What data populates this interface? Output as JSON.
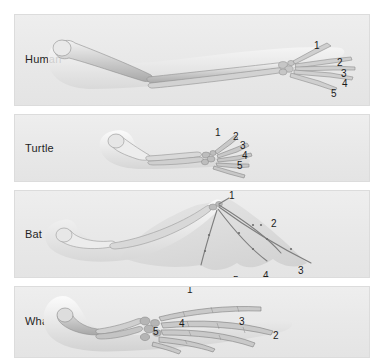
{
  "figure": {
    "title_row": {
      "bones": [
        {
          "label": "Humerus",
          "emphasis": "strong",
          "x": 68
        },
        {
          "label": "Radius",
          "emphasis": "mid",
          "x": 124
        },
        {
          "label": "Ulna",
          "emphasis": "light",
          "x": 169
        },
        {
          "label": "Carpal",
          "emphasis": "mid",
          "x": 201
        },
        {
          "label": "Metacarpal",
          "emphasis": "light",
          "x": 243
        },
        {
          "label": "Phalanges",
          "emphasis": "light",
          "x": 305
        }
      ]
    },
    "panels": [
      {
        "name": "human",
        "species": "Human",
        "limb_type": "arm",
        "digits": [
          {
            "label": "1",
            "x": 313,
            "y": 40
          },
          {
            "label": "2",
            "x": 336,
            "y": 57
          },
          {
            "label": "3",
            "x": 340,
            "y": 68
          },
          {
            "label": "4",
            "x": 341,
            "y": 78
          },
          {
            "label": "5",
            "x": 330,
            "y": 88
          }
        ]
      },
      {
        "name": "turtle",
        "species": "Turtle",
        "limb_type": "flipper",
        "digits": [
          {
            "label": "1",
            "x": 214,
            "y": 127
          },
          {
            "label": "2",
            "x": 232,
            "y": 131
          },
          {
            "label": "3",
            "x": 239,
            "y": 140
          },
          {
            "label": "4",
            "x": 241,
            "y": 150
          },
          {
            "label": "5",
            "x": 236,
            "y": 160
          }
        ]
      },
      {
        "name": "bat",
        "species": "Bat",
        "limb_type": "wing",
        "digits": [
          {
            "label": "1",
            "x": 228,
            "y": 190
          },
          {
            "label": "2",
            "x": 270,
            "y": 218
          },
          {
            "label": "3",
            "x": 297,
            "y": 265
          },
          {
            "label": "4",
            "x": 262,
            "y": 270
          },
          {
            "label": "5",
            "x": 232,
            "y": 275
          }
        ]
      },
      {
        "name": "whale",
        "species": "Whale",
        "limb_type": "flipper",
        "digits": [
          {
            "label": "1",
            "x": 186,
            "y": 288
          },
          {
            "label": "2",
            "x": 272,
            "y": 334
          },
          {
            "label": "3",
            "x": 238,
            "y": 320
          },
          {
            "label": "4",
            "x": 178,
            "y": 322
          },
          {
            "label": "5",
            "x": 152,
            "y": 330
          }
        ]
      }
    ]
  }
}
